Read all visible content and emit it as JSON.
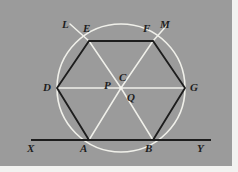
{
  "figure": {
    "caption_absent": true,
    "background_color": "#9b9b9b",
    "plate_border_color": "#f2f2f0",
    "ink_dark_color": "#1d1d1d",
    "ink_light_color": "#f0f0ea",
    "geometry": {
      "center": {
        "x": 121,
        "y": 88
      },
      "circle_radius": 64,
      "hexagon_vertices": [
        {
          "id": "E",
          "x": 89,
          "y": 41
        },
        {
          "id": "F",
          "x": 153,
          "y": 41
        },
        {
          "id": "G",
          "x": 185,
          "y": 88
        },
        {
          "id": "B",
          "x": 153,
          "y": 140
        },
        {
          "id": "A",
          "x": 89,
          "y": 140
        },
        {
          "id": "D",
          "x": 57,
          "y": 88
        }
      ],
      "baseline": {
        "x1": 31,
        "x2": 211,
        "y": 140
      }
    },
    "labels": [
      {
        "id": "L",
        "text": "L",
        "x": 62,
        "y": 19
      },
      {
        "id": "E",
        "text": "E",
        "x": 83,
        "y": 23
      },
      {
        "id": "F",
        "text": "F",
        "x": 143,
        "y": 23
      },
      {
        "id": "M",
        "text": "M",
        "x": 160,
        "y": 19
      },
      {
        "id": "D",
        "text": "D",
        "x": 43,
        "y": 82
      },
      {
        "id": "C",
        "text": "C",
        "x": 119,
        "y": 72
      },
      {
        "id": "P",
        "text": "P",
        "x": 104,
        "y": 80
      },
      {
        "id": "Q",
        "text": "Q",
        "x": 127,
        "y": 92
      },
      {
        "id": "G",
        "text": "G",
        "x": 190,
        "y": 82
      },
      {
        "id": "X",
        "text": "X",
        "x": 27,
        "y": 143
      },
      {
        "id": "A",
        "text": "A",
        "x": 80,
        "y": 143
      },
      {
        "id": "B",
        "text": "B",
        "x": 145,
        "y": 143
      },
      {
        "id": "Y",
        "text": "Y",
        "x": 197,
        "y": 143
      }
    ]
  }
}
